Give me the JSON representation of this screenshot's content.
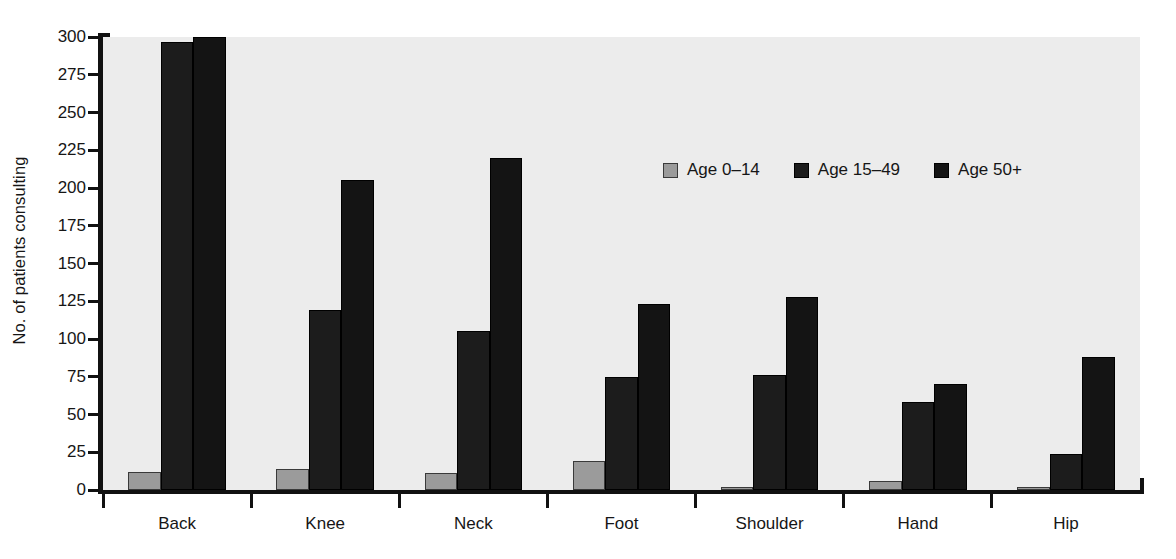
{
  "chart_data": {
    "type": "bar",
    "title": "",
    "subtitle": "",
    "xlabel": "",
    "ylabel": "No. of patients consulting",
    "ylim": [
      0,
      300
    ],
    "yticks": [
      0,
      25,
      50,
      75,
      100,
      125,
      150,
      175,
      200,
      225,
      250,
      275,
      300
    ],
    "ytick_labels": [
      "0",
      "25",
      "50",
      "75",
      "100",
      "125",
      "150",
      "175",
      "200",
      "225",
      "250",
      "275",
      "300"
    ],
    "grid": false,
    "legend_position": "upper center",
    "categories": [
      "Back",
      "Knee",
      "Neck",
      "Foot",
      "Shoulder",
      "Hand",
      "Hip"
    ],
    "series": [
      {
        "name": "Age 0–14",
        "color": "#9b9b9b",
        "values": [
          12,
          14,
          11,
          19,
          2,
          6,
          2
        ]
      },
      {
        "name": "Age 15–49",
        "color": "#1c1c1c",
        "values": [
          297,
          119,
          105,
          75,
          76,
          58,
          24
        ]
      },
      {
        "name": "Age 50+",
        "color": "#141414",
        "values": [
          300,
          205,
          220,
          123,
          128,
          70,
          88
        ]
      }
    ]
  },
  "colors": {
    "plot_background": "#ececec",
    "page_background": "#ffffff",
    "axis": "#111111",
    "text": "#161616"
  }
}
